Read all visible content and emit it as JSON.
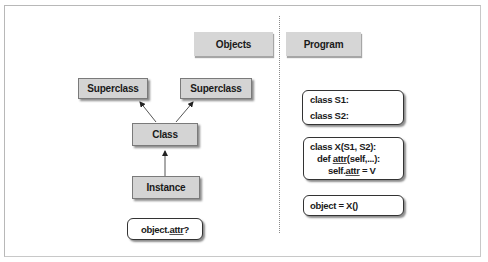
{
  "headers": {
    "objects": "Objects",
    "program": "Program"
  },
  "tree": {
    "superclass_left": "Superclass",
    "superclass_right": "Superclass",
    "class": "Class",
    "instance": "Instance",
    "query": {
      "prefix": "object.",
      "attr": "attr",
      "suffix": "?"
    }
  },
  "program": {
    "block1": {
      "line1": "class S1:",
      "line2": "class S2:"
    },
    "block2": {
      "line1": "class X(S1, S2):",
      "line2_prefix": "def ",
      "line2_attr": "attr",
      "line2_suffix": "(self,...):",
      "line3_prefix": "self.",
      "line3_attr": "attr",
      "line3_suffix": " = V"
    },
    "block3": {
      "line1": "object = X()"
    }
  },
  "colors": {
    "box_fill": "#d4d4d4",
    "box_border": "#7a7a7a",
    "arrow": "#444444",
    "frame": "#b8b8b8"
  }
}
